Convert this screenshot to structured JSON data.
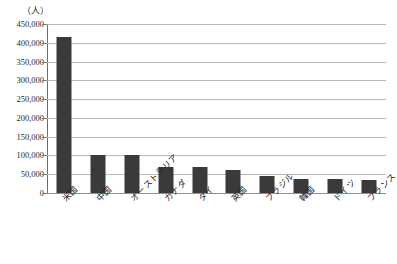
{
  "chart_data": {
    "type": "bar",
    "title": "",
    "subtitle": "",
    "xlabel": "",
    "ylabel": "",
    "unit_label": "（人）",
    "categories": [
      "米国",
      "中国",
      "オーストラリア",
      "カナダ",
      "タイ",
      "英国",
      "ブラジル",
      "韓国",
      "ドイツ",
      "フランス"
    ],
    "values": [
      415000,
      100000,
      100000,
      70000,
      68000,
      62000,
      45000,
      37000,
      38000,
      35000
    ],
    "ylim": [
      0,
      450000
    ],
    "ytick_step": 50000,
    "ytick_labels": [
      "450,000",
      "400,000",
      "350,000",
      "300,000",
      "250,000",
      "200,000",
      "150,000",
      "100,000",
      "50,000",
      "0"
    ],
    "ytick_values": [
      450000,
      400000,
      350000,
      300000,
      250000,
      200000,
      150000,
      100000,
      50000,
      0
    ],
    "grid": true,
    "legend": false,
    "legend_position": "none",
    "bar_color": "#3a3a3a",
    "gridline_color": "#b9b9b9",
    "axis_color": "#6e6e6e",
    "background_color": "#ffffff",
    "label_rotation_degrees": -45
  }
}
